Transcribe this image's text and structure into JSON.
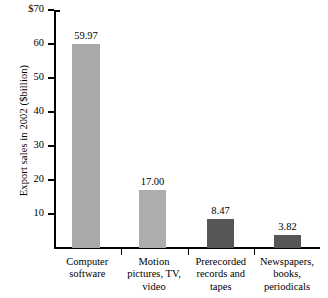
{
  "chart_data": {
    "type": "bar",
    "title": "",
    "subtitle": "",
    "xlabel": "",
    "ylabel": "Export sales in 2002 ($billion)",
    "ylim": [
      0,
      70
    ],
    "yticks": [
      "10",
      "20",
      "30",
      "40",
      "50",
      "60",
      "$70"
    ],
    "ytick_values": [
      10,
      20,
      30,
      40,
      50,
      60,
      70
    ],
    "grid": false,
    "legend": null,
    "categories": [
      "Computer software",
      "Motion pictures, TV, video",
      "Prerecorded records and tapes",
      "Newspapers, books, periodicals"
    ],
    "category_lines": [
      [
        "Computer",
        "software"
      ],
      [
        "Motion",
        "pictures, TV,",
        "video"
      ],
      [
        "Prerecorded",
        "records and",
        "tapes"
      ],
      [
        "Newspapers,",
        "books,",
        "periodicals"
      ]
    ],
    "values": [
      59.97,
      17.0,
      8.47,
      3.82
    ],
    "value_labels": [
      "59.97",
      "17.00",
      "8.47",
      "3.82"
    ],
    "bar_colors": [
      "#a9a9a9",
      "#adadad",
      "#565656",
      "#565656"
    ],
    "axis_color": "#000000",
    "background": "#ffffff"
  }
}
